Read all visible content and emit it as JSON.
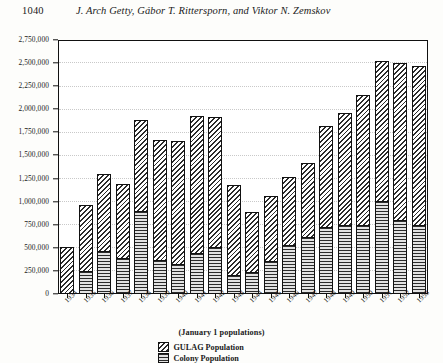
{
  "header": {
    "folio": "1040",
    "authors": "J. Arch Getty, Gábor T. Rittersporn, and Viktor N. Zemskov"
  },
  "figure": {
    "x_axis_caption": "(January 1 populations)",
    "legend": [
      {
        "key": "gulag",
        "label": "GULAG Population",
        "pattern": "diagonal-hatch"
      },
      {
        "key": "colony",
        "label": "Colony Population",
        "pattern": "horizontal-lines"
      }
    ]
  },
  "chart_data": {
    "type": "bar",
    "stacked": true,
    "title": "",
    "subtitle": "",
    "xlabel": "(January 1 populations)",
    "ylabel": "",
    "ylim": [
      0,
      2750000
    ],
    "ytick_step": 250000,
    "grid": true,
    "legend_position": "bottom-center",
    "categories": [
      "1934",
      "1935",
      "1936",
      "1937",
      "1938",
      "1939",
      "1940",
      "1941",
      "1942",
      "1943",
      "1944",
      "1945",
      "1946",
      "1947",
      "1948",
      "1949",
      "1950",
      "1951",
      "1952",
      "1953"
    ],
    "ytick_labels": [
      "0",
      "250,000",
      "500,000",
      "750,000",
      "1,000,000",
      "1,250,000",
      "1,500,000",
      "1,750,000",
      "2,000,000",
      "2,250,000",
      "2,500,000",
      "2,750,000"
    ],
    "ytick_values": [
      0,
      250000,
      500000,
      750000,
      1000000,
      1250000,
      1500000,
      1750000,
      2000000,
      2250000,
      2500000,
      2750000
    ],
    "series": [
      {
        "name": "Colony Population",
        "pattern": "horizontal-lines",
        "values": [
          0,
          240000,
          457000,
          375000,
          885000,
          355000,
          315000,
          430000,
          500000,
          200000,
          230000,
          350000,
          516000,
          610000,
          715000,
          740000,
          740000,
          995000,
          793000,
          740000
        ]
      },
      {
        "name": "GULAG Population",
        "pattern": "diagonal-hatch",
        "values": [
          510000,
          725000,
          839000,
          820000,
          996000,
          1317000,
          1344000,
          1500000,
          1415000,
          983000,
          663000,
          715000,
          746000,
          808000,
          1108000,
          1216000,
          1416000,
          1533000,
          1711000,
          1727000
        ]
      }
    ],
    "totals": [
      510000,
      965000,
      1296000,
      1196000,
      1882000,
      1672000,
      1659000,
      1930000,
      1915000,
      1183000,
      893000,
      1065000,
      1262000,
      1418000,
      1823000,
      1956000,
      2156000,
      2528000,
      2504000,
      2467000
    ]
  }
}
